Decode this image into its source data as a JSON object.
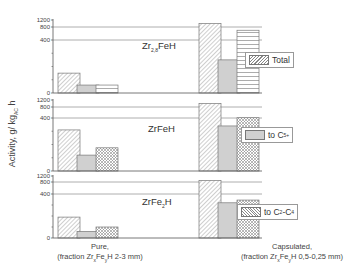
{
  "chart_data": {
    "type": "bar",
    "ylabel": "Activity, g/ kg_AC h",
    "categories": [
      "Pure, (fraction Zr_xFe_yH 2-3 mm)",
      "Capsulated, (fraction Zr_xFe_yH 0,5-0,25 mm)"
    ],
    "yticks": [
      0,
      400,
      800,
      1200
    ],
    "axis_break": "between 400 and 800",
    "grid": "horizontal lines at 400 and 800",
    "panels": [
      {
        "label": "Zr2,8FeH",
        "legend": "Total",
        "series": [
          {
            "name": "Total",
            "values": [
              150,
              1000
            ]
          },
          {
            "name": "to C5+",
            "values": [
              60,
              250
            ]
          },
          {
            "name": "to C2-C4",
            "values": [
              60,
              700
            ]
          }
        ]
      },
      {
        "label": "ZrFeH",
        "legend": "to C5+",
        "series": [
          {
            "name": "Total",
            "values": [
              310,
              1000
            ]
          },
          {
            "name": "to C5+",
            "values": [
              120,
              340
            ]
          },
          {
            "name": "to C2-C4",
            "values": [
              175,
              410
            ]
          }
        ]
      },
      {
        "label": "ZrFe2H",
        "legend": "to C2-C4",
        "series": [
          {
            "name": "Total",
            "values": [
              190,
              900
            ]
          },
          {
            "name": "to C5+",
            "values": [
              60,
              320
            ]
          },
          {
            "name": "to C2-C4",
            "values": [
              100,
              345
            ]
          }
        ]
      }
    ]
  },
  "labels": {
    "ylabel_main": "Activity, g/ kg",
    "ylabel_sub": "AC",
    "ylabel_end": " h",
    "panel1_main": "Zr",
    "panel1_sub": "2,8",
    "panel1_end": "FeH",
    "panel2": "ZrFeH",
    "panel3_main": "ZrFe",
    "panel3_sub": "2",
    "panel3_end": "H",
    "legend_total": "Total",
    "legend_c5_main": "to C",
    "legend_c5_sub": "5+",
    "legend_c2_main": "to C",
    "legend_c2_sub1": "2",
    "legend_c2_mid": "-C",
    "legend_c2_sub2": "4",
    "cat1_line1": "Pure,",
    "cat1_line2a": "(fraction Zr",
    "cat1_sub1": "x",
    "cat1_line2b": "Fe",
    "cat1_sub2": "y",
    "cat1_line2c": "H 2-3 mm)",
    "cat2_line1": "Capsulated,",
    "cat2_line2a": "(fraction Zr",
    "cat2_sub1": "x",
    "cat2_line2b": "Fe",
    "cat2_sub2": "y",
    "cat2_line2c": "H 0,5-0,25 mm)",
    "tick_0": "0",
    "tick_400": "400",
    "tick_800": "800",
    "tick_1200": "1200"
  }
}
